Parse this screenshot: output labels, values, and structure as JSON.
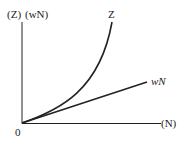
{
  "diagram": {
    "y_axis_label_z": "(Z)",
    "y_axis_label_wn": "(wN)",
    "x_axis_label": "(N)",
    "origin_label": "0",
    "curve_label": "Z",
    "line_label": "wN",
    "stroke_color": "#222222",
    "background_color": "#ffffff"
  }
}
